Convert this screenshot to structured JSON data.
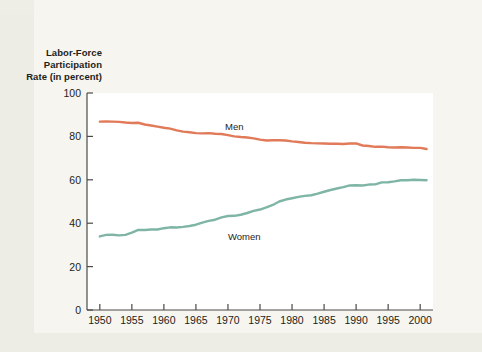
{
  "figure": {
    "background_color": "#eeede5",
    "plot_background_color": "#ffffff",
    "panel_color": "#f6f5ef"
  },
  "chart_data": {
    "type": "line",
    "title": "Labor-Force Participation Rate (in percent)",
    "title_lines": [
      "Labor-Force",
      "Participation",
      "Rate (in percent)"
    ],
    "xlabel": "",
    "ylabel": "Labor-Force Participation Rate (in percent)",
    "xlim": [
      1948,
      2002
    ],
    "ylim": [
      0,
      100
    ],
    "grid": false,
    "legend_position": "inline-annotations",
    "yticks": [
      0,
      20,
      40,
      60,
      80,
      100
    ],
    "ytick_labels": [
      "0",
      "20",
      "40",
      "60",
      "80",
      "100"
    ],
    "xticks": [
      1950,
      1955,
      1960,
      1965,
      1970,
      1975,
      1980,
      1985,
      1990,
      1995,
      2000
    ],
    "xtick_labels": [
      "1950",
      "1955",
      "1960",
      "1965",
      "1970",
      "1975",
      "1980",
      "1985",
      "1990",
      "1995",
      "2000"
    ],
    "series": [
      {
        "name": "Men",
        "color": "#e07a58",
        "label_text": "Men",
        "x": [
          1950,
          1951,
          1952,
          1953,
          1954,
          1955,
          1956,
          1957,
          1958,
          1959,
          1960,
          1961,
          1962,
          1963,
          1964,
          1965,
          1966,
          1967,
          1968,
          1969,
          1970,
          1971,
          1972,
          1973,
          1974,
          1975,
          1976,
          1977,
          1978,
          1979,
          1980,
          1981,
          1982,
          1983,
          1984,
          1985,
          1986,
          1987,
          1988,
          1989,
          1990,
          1991,
          1992,
          1993,
          1994,
          1995,
          1996,
          1997,
          1998,
          1999,
          2000,
          2001
        ],
        "values": [
          86.8,
          86.9,
          86.8,
          86.7,
          86.4,
          86.2,
          86.3,
          85.5,
          85.0,
          84.5,
          84.0,
          83.6,
          82.8,
          82.2,
          81.9,
          81.5,
          81.4,
          81.5,
          81.2,
          81.1,
          80.6,
          80.0,
          79.7,
          79.5,
          79.1,
          78.5,
          78.1,
          78.2,
          78.2,
          78.1,
          77.7,
          77.4,
          77.1,
          76.9,
          76.8,
          76.7,
          76.6,
          76.6,
          76.5,
          76.7,
          76.8,
          75.8,
          75.6,
          75.2,
          75.3,
          75.0,
          74.9,
          75.0,
          74.9,
          74.7,
          74.7,
          74.2
        ]
      },
      {
        "name": "Women",
        "color": "#7fb5a6",
        "label_text": "Women",
        "x": [
          1950,
          1951,
          1952,
          1953,
          1954,
          1955,
          1956,
          1957,
          1958,
          1959,
          1960,
          1961,
          1962,
          1963,
          1964,
          1965,
          1966,
          1967,
          1968,
          1969,
          1970,
          1971,
          1972,
          1973,
          1974,
          1975,
          1976,
          1977,
          1978,
          1979,
          1980,
          1981,
          1982,
          1983,
          1984,
          1985,
          1986,
          1987,
          1988,
          1989,
          1990,
          1991,
          1992,
          1993,
          1994,
          1995,
          1996,
          1997,
          1998,
          1999,
          2000,
          2001
        ],
        "values": [
          33.9,
          34.6,
          34.7,
          34.4,
          34.6,
          35.7,
          36.9,
          36.9,
          37.1,
          37.1,
          37.7,
          38.1,
          38.0,
          38.3,
          38.7,
          39.3,
          40.3,
          41.1,
          41.6,
          42.7,
          43.3,
          43.4,
          43.9,
          44.7,
          45.7,
          46.3,
          47.3,
          48.4,
          50.0,
          50.9,
          51.5,
          52.1,
          52.6,
          52.9,
          53.6,
          54.5,
          55.3,
          56.0,
          56.6,
          57.4,
          57.5,
          57.4,
          57.8,
          57.9,
          58.8,
          58.9,
          59.3,
          59.8,
          59.8,
          60.0,
          59.9,
          59.8
        ]
      }
    ]
  }
}
